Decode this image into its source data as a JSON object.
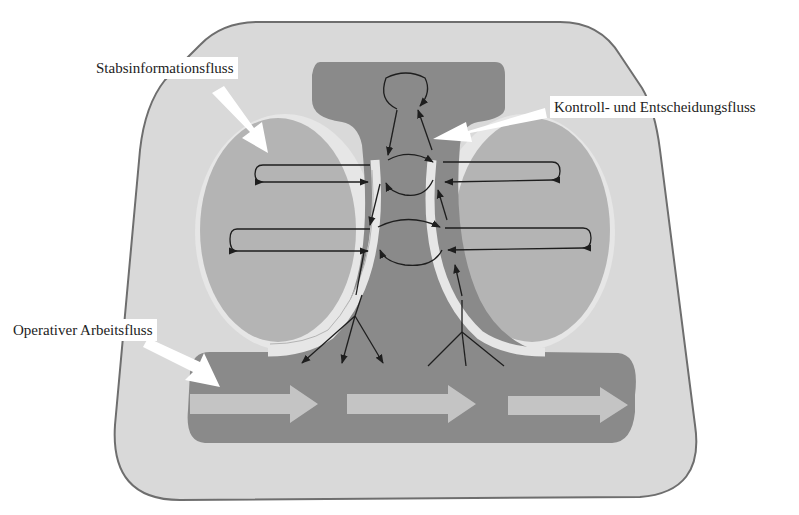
{
  "diagram": {
    "labels": {
      "staff_flow": "Stabsinformationsfluss",
      "control_flow": "Kontroll- und Entscheidungsfluss",
      "operative_flow": "Operativer Arbeitsfluss"
    },
    "colors": {
      "outer_fill": "#d9d9d9",
      "outer_stroke": "#6e6e6e",
      "core_fill": "#8a8a8a",
      "oval_fill": "#b4b4b4",
      "halo_fill": "#e6e6e6",
      "flow_arrow_fill": "#c4c4c4",
      "pointer_fill": "#ffffff",
      "line_color": "#1e1e1e"
    }
  }
}
